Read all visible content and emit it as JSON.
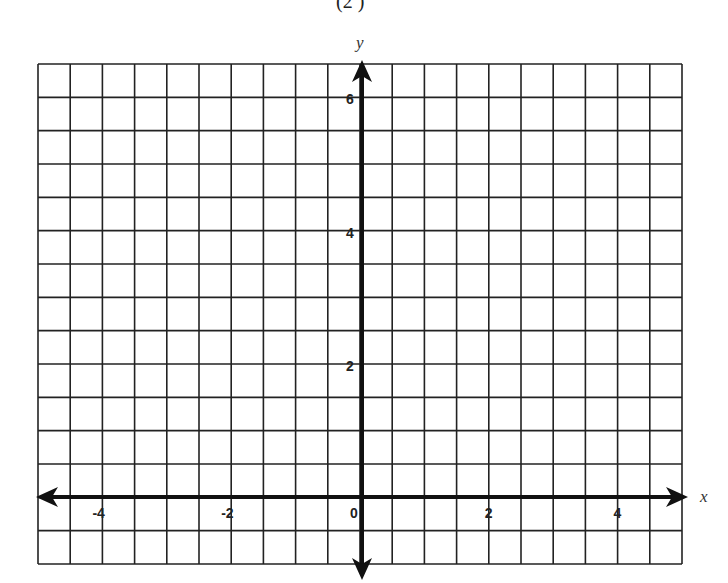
{
  "header": {
    "title_fragment": "(2 )"
  },
  "chart_data": {
    "type": "line",
    "title": "",
    "xlabel": "x",
    "ylabel": "y",
    "xlim": [
      -5,
      5
    ],
    "ylim": [
      -1,
      6.5
    ],
    "grid": true,
    "grid_step": 0.5,
    "x_ticks": [
      -4,
      -2,
      0,
      2,
      4
    ],
    "y_ticks": [
      2,
      4,
      6
    ],
    "x_tick_labels": [
      "-4",
      "-2",
      "0",
      "2",
      "4"
    ],
    "y_tick_labels": [
      "2",
      "4",
      "6"
    ],
    "series": []
  },
  "colors": {
    "grid": "#222222",
    "axis": "#111111",
    "background": "#ffffff"
  }
}
